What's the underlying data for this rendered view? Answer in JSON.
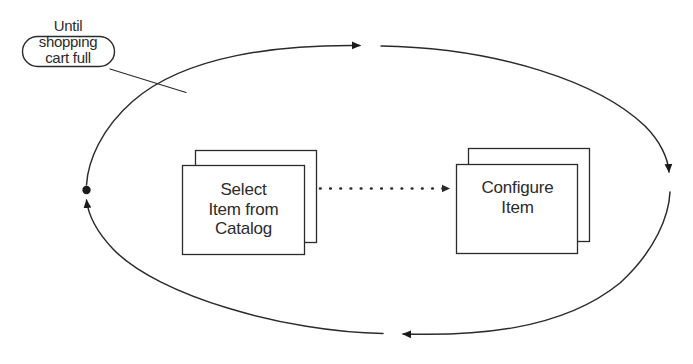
{
  "diagram": {
    "type": "uml-activity-loop",
    "background_color": "#ffffff",
    "line_color": "#2b2b2b",
    "text_color": "#2b2b2b",
    "nodes": [
      {
        "id": "select-item",
        "label": "Select\nItem from\nCatalog",
        "shape": "stacked-rectangle"
      },
      {
        "id": "configure-item",
        "label": "Configure\nItem",
        "shape": "stacked-rectangle"
      }
    ],
    "guard_label": {
      "id": "until-shopping-cart-full",
      "text": "Until\nshopping\ncart full",
      "shape": "rounded-pill-outline"
    },
    "connectors": [
      {
        "id": "select-to-configure",
        "style": "dotted",
        "arrowhead": "filled-triangle",
        "from": "select-item",
        "to": "configure-item"
      },
      {
        "id": "loop-ellipse",
        "style": "solid",
        "shape": "ellipse",
        "arrowheads": [
          "top-right",
          "right-down",
          "bottom-left",
          "left-up"
        ],
        "start_marker": "filled-ball"
      },
      {
        "id": "guard-leader-line",
        "style": "solid",
        "arrowhead": "none"
      }
    ]
  }
}
